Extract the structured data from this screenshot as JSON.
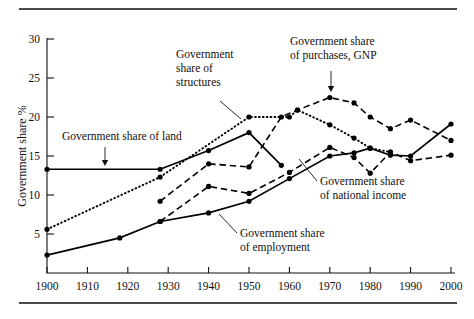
{
  "chart_data": {
    "type": "line",
    "title": "",
    "xlabel": "",
    "ylabel": "Government share %",
    "xlim": [
      1900,
      2000
    ],
    "ylim": [
      0,
      30
    ],
    "grid": false,
    "legend_position": "inline-annotations",
    "x_ticks": [
      1900,
      1910,
      1920,
      1930,
      1940,
      1950,
      1960,
      1970,
      1980,
      1990,
      2000
    ],
    "y_ticks": [
      5,
      10,
      15,
      20,
      25,
      30
    ],
    "series": [
      {
        "name": "Government share of land",
        "style": "solid",
        "x": [
          1900,
          1928,
          1940,
          1950,
          1958
        ],
        "values": [
          13.3,
          13.3,
          15.7,
          18.0,
          13.8
        ]
      },
      {
        "name": "Government share of structures",
        "style": "dotted",
        "x": [
          1900,
          1928,
          1950,
          1960,
          1962,
          1970,
          1976,
          1980,
          1985
        ],
        "values": [
          5.6,
          12.3,
          20.0,
          20.0,
          20.9,
          19.0,
          17.3,
          16.0,
          15.5
        ]
      },
      {
        "name": "Government share of purchases, GNP",
        "style": "dashed",
        "x": [
          1928,
          1940,
          1950,
          1958,
          1962,
          1970,
          1976,
          1980,
          1985,
          1990,
          2000
        ],
        "values": [
          9.2,
          14.0,
          13.6,
          20.0,
          20.9,
          22.5,
          21.8,
          20.0,
          18.5,
          19.6,
          17.0
        ]
      },
      {
        "name": "Government share of national income",
        "style": "dashed",
        "x": [
          1928,
          1940,
          1950,
          1960,
          1970,
          1976,
          1980,
          1985,
          1990,
          2000
        ],
        "values": [
          6.6,
          11.1,
          10.2,
          12.9,
          16.1,
          14.8,
          12.8,
          15.5,
          14.4,
          15.1
        ]
      },
      {
        "name": "Government share of employment",
        "style": "solid",
        "x": [
          1900,
          1918,
          1928,
          1940,
          1950,
          1960,
          1970,
          1976,
          1980,
          1985,
          1990,
          2000
        ],
        "values": [
          2.3,
          4.5,
          6.6,
          7.7,
          9.2,
          12.1,
          15.0,
          15.4,
          16.0,
          15.1,
          15.0,
          19.1
        ]
      }
    ],
    "annotations": [
      {
        "id": "annot-land",
        "lines": [
          "Government share of land"
        ],
        "text_x": 62,
        "text_y": 140,
        "pointer": "arrow-down",
        "arrow_from_x": 105,
        "arrow_from_y": 147,
        "arrow_to_x": 105,
        "arrow_to_y": 166
      },
      {
        "id": "annot-structures",
        "lines": [
          "Government",
          "share of",
          "structures"
        ],
        "text_x": 176,
        "text_y": 58,
        "pointer": "leader",
        "leader_from_x": 220,
        "leader_from_y": 101,
        "leader_to_x": 241,
        "leader_to_y": 119
      },
      {
        "id": "annot-purchases",
        "lines": [
          "Government share",
          "of purchases, GNP"
        ],
        "text_x": 290,
        "text_y": 45,
        "pointer": "arrow-down",
        "arrow_from_x": 331,
        "arrow_from_y": 71,
        "arrow_to_x": 331,
        "arrow_to_y": 92
      },
      {
        "id": "annot-national-income",
        "lines": [
          "Government share",
          "of national income"
        ],
        "text_x": 320,
        "text_y": 185,
        "pointer": "leader",
        "leader_from_x": 317,
        "leader_from_y": 181,
        "leader_to_x": 299,
        "leader_to_y": 159
      },
      {
        "id": "annot-employment",
        "lines": [
          "Government share",
          "of employment"
        ],
        "text_x": 240,
        "text_y": 237,
        "pointer": "leader",
        "leader_from_x": 237,
        "leader_from_y": 233,
        "leader_to_x": 219,
        "leader_to_y": 214
      }
    ]
  },
  "figure": {
    "top_rule": "",
    "bottom_rule": ""
  }
}
